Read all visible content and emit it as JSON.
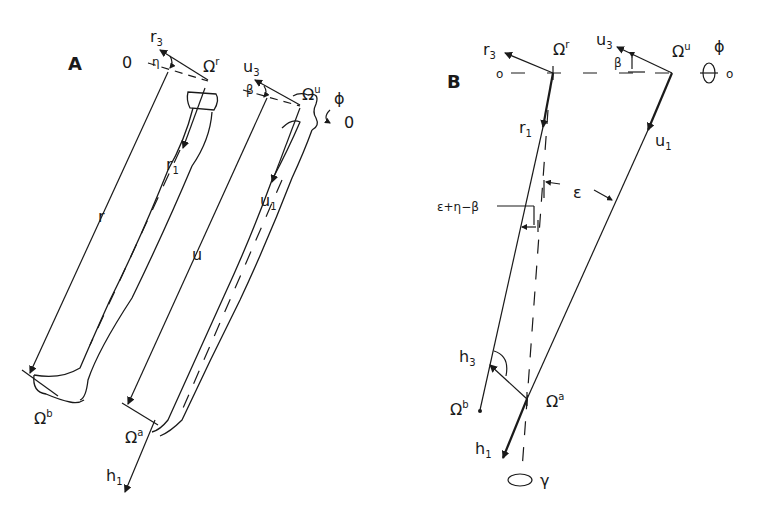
{
  "figure": {
    "panel_a": {
      "label": "A",
      "labels": {
        "r3": "r",
        "r3_sub": "3",
        "origin_left": "0",
        "eta": "η",
        "omega_r": "Ω",
        "omega_r_sup": "r",
        "u3": "u",
        "u3_sub": "3",
        "beta": "β",
        "omega_u": "Ω",
        "omega_u_sup": "u",
        "phi": "ϕ",
        "origin_right": "0",
        "r1": "r",
        "r1_sub": "1",
        "u1": "u",
        "u1_sub": "1",
        "r_len": "r",
        "u_len": "u",
        "omega_b": "Ω",
        "omega_b_sup": "b",
        "omega_a": "Ω",
        "omega_a_sup": "a",
        "h1": "h",
        "h1_sub": "1"
      }
    },
    "panel_b": {
      "label": "B",
      "labels": {
        "r3": "r",
        "r3_sub": "3",
        "omega_r": "Ω",
        "omega_r_sup": "r",
        "u3": "u",
        "u3_sub": "3",
        "omega_u": "Ω",
        "omega_u_sup": "u",
        "phi": "ϕ",
        "origin_left": "o",
        "origin_right": "o",
        "beta": "β",
        "r1": "r",
        "r1_sub": "1",
        "u1": "u",
        "u1_sub": "1",
        "epsilon": "ε",
        "compound_angle": "ε+η−β",
        "h3": "h",
        "h3_sub": "3",
        "omega_b": "Ω",
        "omega_b_sup": "b",
        "omega_a": "Ω",
        "omega_a_sup": "a",
        "h1": "h",
        "h1_sub": "1",
        "gamma": "γ"
      }
    }
  }
}
